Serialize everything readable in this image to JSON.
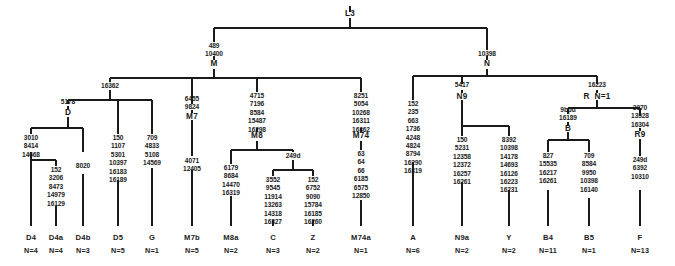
{
  "diagram": {
    "type": "phylogenetic-tree",
    "line_color": "#1a1a1a",
    "text_color": "#1a1a1a",
    "background": "#ffffff"
  },
  "nodes": [
    {
      "id": "L3",
      "label": "L3",
      "x": 350,
      "y": 14,
      "mutations": []
    },
    {
      "id": "M",
      "label": "M",
      "x": 214,
      "y": 65,
      "mutations": [
        "489",
        "10400"
      ]
    },
    {
      "id": "N",
      "label": "N",
      "x": 487,
      "y": 65,
      "mutations": [
        "10398"
      ]
    },
    {
      "id": "n16362",
      "label": "",
      "x": 110,
      "y": 86,
      "mutations": [
        "16362"
      ]
    },
    {
      "id": "D",
      "label": "D",
      "x": 68,
      "y": 113,
      "mutations": [
        "5178"
      ]
    },
    {
      "id": "D4node",
      "label": "",
      "x": 56,
      "y": 158,
      "mutations": []
    },
    {
      "id": "M8",
      "label": "M8",
      "x": 257,
      "y": 137,
      "mutations": [
        "4715",
        "7196",
        "8584",
        "15487",
        "16298"
      ]
    },
    {
      "id": "249d",
      "label": "",
      "x": 293,
      "y": 156,
      "mutations": [
        "249d"
      ]
    },
    {
      "id": "M7",
      "label": "M7",
      "x": 192,
      "y": 116,
      "mutations": [
        "6455",
        "9824"
      ]
    },
    {
      "id": "M74",
      "label": "M74",
      "x": 361,
      "y": 137,
      "mutations": [
        "8251",
        "5054",
        "10268",
        "16311",
        "16362"
      ]
    },
    {
      "id": "N9",
      "label": "N9",
      "x": 462,
      "y": 96,
      "mutations": [
        "5417"
      ]
    },
    {
      "id": "R",
      "label": "R  N=1",
      "x": 597,
      "y": 96,
      "mutations": [
        "16223"
      ]
    },
    {
      "id": "B",
      "label": "B",
      "x": 568,
      "y": 128,
      "mutations": [
        "9bpd",
        "16189"
      ]
    },
    {
      "id": "R9",
      "label": "R9",
      "x": 640,
      "y": 135,
      "mutations": [
        "3970",
        "13928",
        "16304"
      ]
    }
  ],
  "leaves": [
    {
      "id": "D4",
      "label": "D4",
      "count": "N=4",
      "x": 31,
      "mutations": [
        "3010",
        "8414",
        "14668"
      ]
    },
    {
      "id": "D4a",
      "label": "D4a",
      "count": "N=4",
      "x": 56,
      "mutations": [
        "152",
        "3206",
        "8473",
        "14979",
        "16129"
      ]
    },
    {
      "id": "D4b",
      "label": "D4b",
      "count": "N=3",
      "x": 83,
      "mutations": [
        "8020"
      ]
    },
    {
      "id": "D5",
      "label": "D5",
      "count": "N=5",
      "x": 118,
      "mutations": [
        "150",
        "1107",
        "5301",
        "10397",
        "16183",
        "16189"
      ]
    },
    {
      "id": "G",
      "label": "G",
      "count": "N=1",
      "x": 152,
      "mutations": [
        "709",
        "4833",
        "5108",
        "14569"
      ]
    },
    {
      "id": "M7b",
      "label": "M7b",
      "count": "N=5",
      "x": 192,
      "mutations": [
        "4071",
        "12405"
      ]
    },
    {
      "id": "M8a",
      "label": "M8a",
      "count": "N=2",
      "x": 231,
      "mutations": [
        "6179",
        "8684",
        "14470",
        "16319"
      ]
    },
    {
      "id": "C",
      "label": "C",
      "count": "N=3",
      "x": 273,
      "mutations": [
        "3552",
        "9545",
        "11914",
        "13263",
        "14318",
        "16327"
      ]
    },
    {
      "id": "Z",
      "label": "Z",
      "count": "N=2",
      "x": 313,
      "mutations": [
        "152",
        "6752",
        "9090",
        "15784",
        "16185",
        "16260"
      ]
    },
    {
      "id": "M74a",
      "label": "M74a",
      "count": "N=1",
      "x": 361,
      "mutations": [
        "63",
        "64",
        "66",
        "6185",
        "6575",
        "12850"
      ]
    },
    {
      "id": "A",
      "label": "A",
      "count": "N=6",
      "x": 413,
      "mutations": [
        "152",
        "235",
        "663",
        "1736",
        "4248",
        "4824",
        "8794",
        "16290",
        "16319"
      ]
    },
    {
      "id": "N9a",
      "label": "N9a",
      "count": "N=2",
      "x": 462,
      "mutations": [
        "150",
        "5231",
        "12358",
        "12372",
        "16257",
        "16261"
      ]
    },
    {
      "id": "Y",
      "label": "Y",
      "count": "N=2",
      "x": 509,
      "mutations": [
        "8392",
        "10398",
        "14178",
        "14693",
        "16126",
        "16223",
        "16231"
      ]
    },
    {
      "id": "B4",
      "label": "B4",
      "count": "N=11",
      "x": 548,
      "mutations": [
        "827",
        "15535",
        "16217",
        "16261"
      ]
    },
    {
      "id": "B5",
      "label": "B5",
      "count": "N=1",
      "x": 589,
      "mutations": [
        "709",
        "8584",
        "9950",
        "10398",
        "16140"
      ]
    },
    {
      "id": "F",
      "label": "F",
      "count": "N=13",
      "x": 640,
      "mutations": [
        "249d",
        "6392",
        "10310"
      ]
    }
  ],
  "leaf_row": {
    "name_y": 234,
    "count_y": 247
  }
}
